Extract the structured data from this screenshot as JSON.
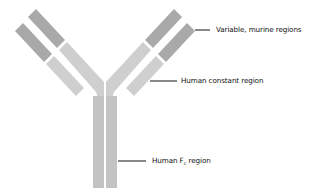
{
  "colors": {
    "background": "#ffffff",
    "variable_region": "#a9a9a9",
    "constant_region": "#cfcfcf",
    "fc_region": "#c3c3c3",
    "leader_line": "#111111"
  },
  "labels": {
    "variable": "Variable, murine regions",
    "constant": "Human constant region",
    "fc_prefix": "Human ",
    "fc_main": "F",
    "fc_sub": "c",
    "fc_suffix": " region"
  }
}
